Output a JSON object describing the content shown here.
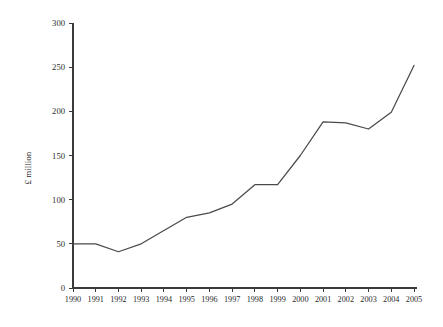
{
  "chart_data": {
    "type": "line",
    "title": "",
    "subtitle": "",
    "xlabel": "",
    "ylabel": "£ million",
    "categories": [
      "1990",
      "1991",
      "1992",
      "1993",
      "1994",
      "1995",
      "1996",
      "1997",
      "1998",
      "1999",
      "2000",
      "2001",
      "2002",
      "2003",
      "2004",
      "2005"
    ],
    "x": [
      1990,
      1991,
      1992,
      1993,
      1994,
      1995,
      1996,
      1997,
      1998,
      1999,
      2000,
      2001,
      2002,
      2003,
      2004,
      2005
    ],
    "values": [
      50,
      50,
      41,
      50,
      65,
      80,
      85,
      95,
      117,
      117,
      150,
      188,
      187,
      180,
      199,
      252
    ],
    "series": [
      {
        "name": "£ million",
        "values": [
          50,
          50,
          41,
          50,
          65,
          80,
          85,
          95,
          117,
          117,
          150,
          188,
          187,
          180,
          199,
          252
        ]
      }
    ],
    "ylim": [
      0,
      300
    ],
    "yticks": [
      0,
      50,
      100,
      150,
      200,
      250,
      300
    ],
    "ytick_labels": [
      "0",
      "50",
      "100",
      "150",
      "200",
      "250",
      "300"
    ],
    "xticks": [
      1990,
      1991,
      1992,
      1993,
      1994,
      1995,
      1996,
      1997,
      1998,
      1999,
      2000,
      2001,
      2002,
      2003,
      2004,
      2005
    ],
    "xtick_labels": [
      "1990",
      "1991",
      "1992",
      "1993",
      "1994",
      "1995",
      "1996",
      "1997",
      "1998",
      "1999",
      "2000",
      "2001",
      "2002",
      "2003",
      "2004",
      "2005"
    ],
    "grid": false,
    "legend": false,
    "legend_position": "none",
    "line_color": "#4a4a4a",
    "axis_color": "#3a3a3a",
    "background_color": "#ffffff",
    "annotations": []
  },
  "layout": {
    "plot_left": 73,
    "plot_right": 414,
    "plot_bottom": 288,
    "plot_top": 23,
    "ytick_label_x": 65,
    "xtick_label_y": 302,
    "ylabel_x": 31,
    "ylabel_y": 168
  }
}
